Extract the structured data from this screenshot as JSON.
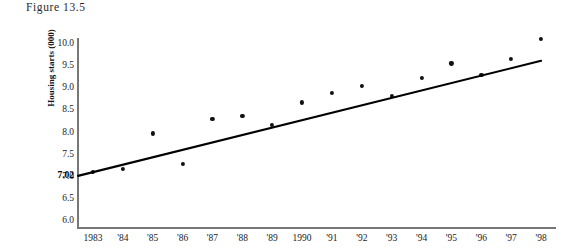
{
  "figure": {
    "caption": "Figure 13.5"
  },
  "chart_data": {
    "type": "scatter",
    "title": "Figure 13.5",
    "xlabel": "",
    "ylabel": "Housing starts (000)",
    "grid": false,
    "legend": null,
    "xlim": [
      1982.5,
      1998.5
    ],
    "ylim": [
      6.0,
      10.25
    ],
    "ytick_labels": [
      "10.0",
      "9.5",
      "9.0",
      "8.5",
      "8.0",
      "7.5",
      "7.0",
      "6.5",
      "6.0"
    ],
    "ytick_values": [
      10.0,
      9.5,
      9.0,
      8.5,
      8.0,
      7.5,
      7.0,
      6.5,
      6.0
    ],
    "categories": [
      "1983",
      "'84",
      "'85",
      "'86",
      "'87",
      "'88",
      "'89",
      "1990",
      "'91",
      "'92",
      "'93",
      "'94",
      "'95",
      "'96",
      "'97",
      "'98"
    ],
    "x": [
      1983,
      1984,
      1985,
      1986,
      1987,
      1988,
      1989,
      1990,
      1991,
      1992,
      1993,
      1994,
      1995,
      1996,
      1997,
      1998
    ],
    "values": [
      7.11,
      7.17,
      7.98,
      7.29,
      8.31,
      8.37,
      8.18,
      8.68,
      8.89,
      9.06,
      8.83,
      9.24,
      9.56,
      9.3,
      9.66,
      10.11
    ],
    "series": [
      {
        "name": "Housing starts",
        "marker": "filled-circle",
        "color": "#111111",
        "values": [
          7.11,
          7.17,
          7.98,
          7.29,
          8.31,
          8.37,
          8.18,
          8.68,
          8.89,
          9.06,
          8.83,
          9.24,
          9.56,
          9.3,
          9.66,
          10.11
        ]
      }
    ],
    "trendline": {
      "type": "linear-fit",
      "color": "#000000",
      "y_start": 7.02,
      "y_end": 9.62,
      "x_start": 1982.5,
      "x_end": 1998.0,
      "intercept_label": "7.02"
    },
    "annotations": [
      {
        "name": "y-intercept",
        "text": "7.02",
        "value": 7.02,
        "bold": true
      }
    ]
  },
  "axes": {
    "y_title": "Housing starts (000)",
    "y_intercept_label": "7.02"
  },
  "colors": {
    "axis": "#777777",
    "marker": "#111111",
    "line": "#000000",
    "text": "#222222",
    "background": "#ffffff"
  }
}
